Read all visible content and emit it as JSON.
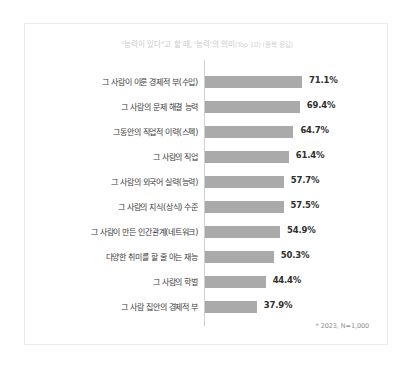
{
  "card": {
    "title_main": "\"능력이 있다\"고 할 때, '능력'의 의미",
    "title_sub": "(Top 10) (중복 응답)",
    "footnote": "* 2023, N=1,000"
  },
  "colors": {
    "bar": "#aaaaaa",
    "axis": "#cfcfcf",
    "card_border": "#ececec",
    "title_text": "#c9c9c9",
    "label_text": "#3a3a3a",
    "value_text": "#2f2f2f",
    "footnote_text": "#8e8e8e",
    "background": "#ffffff"
  },
  "chart_data": {
    "type": "bar",
    "orientation": "horizontal",
    "title": "\"능력이 있다\"고 할 때, '능력'의 의미(Top 10) (중복 응답)",
    "xlabel": "",
    "ylabel": "",
    "xlim": [
      0,
      100
    ],
    "grid": false,
    "legend": false,
    "note": "* 2023, N=1,000",
    "categories": [
      "그 사람이 이룬 경제적 부(수입)",
      "그 사람의 문제 해결 능력",
      "그동안의 직업적 이력(스펙)",
      "그 사람의 직업",
      "그 사람의 외국어 실력(능력)",
      "그 사람의 지식(상식) 수준",
      "그 사람이 만든 인간관계(네트워크)",
      "다양한 취미를 할 줄 아는 재능",
      "그 사람의 학벌",
      "그 사람 집안의 경제적 부"
    ],
    "values": [
      71.1,
      69.4,
      64.7,
      61.4,
      57.7,
      57.5,
      54.9,
      50.3,
      44.4,
      37.9
    ],
    "value_labels": [
      "71.1%",
      "69.4%",
      "64.7%",
      "61.4%",
      "57.7%",
      "57.5%",
      "54.9%",
      "50.3%",
      "44.4%",
      "37.9%"
    ]
  }
}
